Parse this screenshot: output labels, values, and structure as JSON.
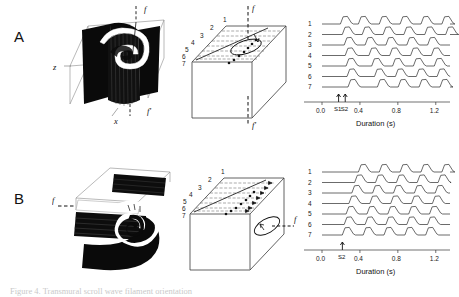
{
  "figure": {
    "caption": "Figure 4. Transmural scroll wave filament orientation",
    "panels": [
      {
        "id": "A",
        "letter": "A",
        "render": {
          "name": "scroll-wave-render-a",
          "labels": [
            {
              "text": "f",
              "x": 92,
              "y": 10
            },
            {
              "text": "f'",
              "x": 96,
              "y": 112
            },
            {
              "text": "z",
              "x": 2,
              "y": 68
            },
            {
              "text": "x",
              "x": 66,
              "y": 120
            }
          ],
          "filament_orientation": "transmural-vertical"
        },
        "block": {
          "name": "tissue-block-a",
          "site_labels": [
            "1",
            "2",
            "3",
            "4",
            "5",
            "6",
            "7"
          ],
          "filament_labels": [
            {
              "text": "f",
              "x": 66,
              "y": 9
            },
            {
              "text": "f'",
              "x": 66,
              "y": 122
            }
          ],
          "filament_orientation": "vertical-through-block"
        },
        "trace": {
          "name": "electrogram-panel-a",
          "channel_labels": [
            "1",
            "2",
            "3",
            "4",
            "5",
            "6",
            "7"
          ],
          "stimuli": [
            {
              "label": "S1",
              "time": 0.175
            },
            {
              "label": "S2",
              "time": 0.245
            }
          ],
          "axis": {
            "label": "Duration (s)",
            "ticks": [
              "0.0",
              "0.4",
              "0.8",
              "1.2"
            ],
            "tick_values": [
              0.0,
              0.4,
              0.8,
              1.2
            ],
            "min": 0.0,
            "max": 1.35
          }
        }
      },
      {
        "id": "B",
        "letter": "B",
        "render": {
          "name": "scroll-wave-render-b",
          "labels": [
            {
              "text": "f",
              "x": -2,
              "y": 52
            }
          ],
          "filament_orientation": "intramural-horizontal"
        },
        "block": {
          "name": "tissue-block-b",
          "site_labels": [
            "1",
            "2",
            "3",
            "4",
            "5",
            "6",
            "7"
          ],
          "filament_labels": [
            {
              "text": "f",
              "x": 112,
              "y": 58
            }
          ],
          "filament_orientation": "horizontal-into-block"
        },
        "trace": {
          "name": "electrogram-panel-b",
          "channel_labels": [
            "1",
            "2",
            "3",
            "4",
            "5",
            "6",
            "7"
          ],
          "stimuli": [
            {
              "label": "S2",
              "time": 0.215
            }
          ],
          "axis": {
            "label": "Duration (s)",
            "ticks": [
              "0.0",
              "0.4",
              "0.8",
              "1.2"
            ],
            "tick_values": [
              0.0,
              0.4,
              0.8,
              1.2
            ],
            "min": 0.0,
            "max": 1.35
          }
        }
      }
    ]
  },
  "chart_data": [
    {
      "type": "line",
      "title": "Panel A electrograms",
      "xlabel": "Duration (s)",
      "ylabel": "",
      "xlim": [
        0.0,
        1.35
      ],
      "grid": false,
      "legend": "none",
      "x_ticks": [
        0.0,
        0.4,
        0.8,
        1.2
      ],
      "annotations": [
        {
          "label": "S1",
          "x": 0.175
        },
        {
          "label": "S2",
          "x": 0.245
        }
      ],
      "series": [
        {
          "name": "1",
          "onsets": [
            0.21,
            0.4,
            0.62,
            0.84,
            1.06,
            1.28
          ]
        },
        {
          "name": "2",
          "onsets": [
            0.23,
            0.44,
            0.66,
            0.88,
            1.1,
            1.32
          ]
        },
        {
          "name": "3",
          "onsets": [
            0.25,
            0.47,
            0.69,
            0.91,
            1.13
          ]
        },
        {
          "name": "4",
          "onsets": [
            0.26,
            0.51,
            0.73,
            0.95,
            1.17
          ]
        },
        {
          "name": "5",
          "onsets": [
            0.27,
            0.54,
            0.76,
            0.98,
            1.2
          ]
        },
        {
          "name": "6",
          "onsets": [
            0.28,
            0.57,
            0.79,
            1.01,
            1.23
          ]
        },
        {
          "name": "7",
          "onsets": [
            0.29,
            0.6,
            0.82,
            1.04,
            1.26
          ]
        }
      ]
    },
    {
      "type": "line",
      "title": "Panel B electrograms",
      "xlabel": "Duration (s)",
      "ylabel": "",
      "xlim": [
        0.0,
        1.35
      ],
      "grid": false,
      "legend": "none",
      "x_ticks": [
        0.0,
        0.4,
        0.8,
        1.2
      ],
      "annotations": [
        {
          "label": "S2",
          "x": 0.215
        }
      ],
      "series": [
        {
          "name": "1",
          "onsets": [
            0.4,
            0.62,
            0.84,
            1.06,
            1.28
          ]
        },
        {
          "name": "2",
          "onsets": [
            0.36,
            0.58,
            0.8,
            1.02,
            1.24
          ]
        },
        {
          "name": "3",
          "onsets": [
            0.33,
            0.55,
            0.77,
            0.99,
            1.21
          ]
        },
        {
          "name": "4",
          "onsets": [
            0.3,
            0.52,
            0.74,
            0.96,
            1.18
          ]
        },
        {
          "name": "5",
          "onsets": [
            0.27,
            0.49,
            0.71,
            0.93,
            1.15
          ]
        },
        {
          "name": "6",
          "onsets": [
            0.25,
            0.47,
            0.69,
            0.91,
            1.13
          ]
        },
        {
          "name": "7",
          "onsets": [
            0.23,
            0.45,
            0.67,
            0.89,
            1.11
          ]
        }
      ]
    }
  ]
}
